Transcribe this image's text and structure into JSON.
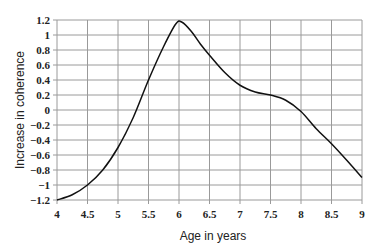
{
  "chart_data": {
    "type": "line",
    "title": "",
    "xlabel": "Age in years",
    "ylabel": "Increase in coherence",
    "xlim": [
      4,
      9
    ],
    "ylim": [
      -1.2,
      1.2
    ],
    "xticks": [
      "4",
      "4.5",
      "5",
      "5.5",
      "6",
      "6.5",
      "7",
      "7.5",
      "8",
      "8.5",
      "9"
    ],
    "yticks": [
      "1.2",
      "1",
      "0.8",
      "0.6",
      "0.4",
      "0.2",
      "0",
      "−0.2",
      "−0.4",
      "−0.6",
      "−0.8",
      "−1",
      "−1.2"
    ],
    "grid": true,
    "legend": null,
    "series": [
      {
        "name": "coherence",
        "color": "#111111",
        "x": [
          4.0,
          4.25,
          4.5,
          4.75,
          5.0,
          5.25,
          5.5,
          5.75,
          5.95,
          6.05,
          6.2,
          6.35,
          6.5,
          6.75,
          7.0,
          7.25,
          7.5,
          7.75,
          8.0,
          8.25,
          8.5,
          8.75,
          9.0
        ],
        "values": [
          -1.2,
          -1.13,
          -1.0,
          -0.8,
          -0.5,
          -0.1,
          0.4,
          0.85,
          1.15,
          1.17,
          1.05,
          0.88,
          0.73,
          0.5,
          0.33,
          0.24,
          0.2,
          0.13,
          -0.02,
          -0.25,
          -0.45,
          -0.67,
          -0.9
        ]
      }
    ]
  }
}
